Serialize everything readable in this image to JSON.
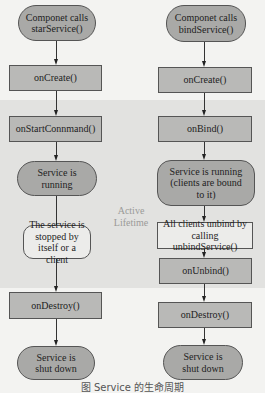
{
  "diagram": {
    "band_label": "Active Lifetime",
    "colors": {
      "background": "#f3f3f1",
      "band": "#e2e2e0",
      "rect_fill": "#b9b9b7",
      "oval_fill": "#a9a9a7",
      "light_fill": "#ececea"
    },
    "left": {
      "start": "Componet calls starService()",
      "on_create": "onCreate()",
      "on_start_command": "onStartConnmand()",
      "running": "Service is running",
      "stopped": "The service is stopped by itself or a client",
      "on_destroy": "onDestroy()",
      "shut_down": "Service is shut down"
    },
    "right": {
      "start": "Componet calls bindService()",
      "on_create": "onCreate()",
      "on_bind": "onBind()",
      "running": "Service is running (clients are bound to it)",
      "unbind": "All clients unbind by calling unbindService()",
      "on_unbind": "onUnbind()",
      "on_destroy": "onDestroy()",
      "shut_down": "Service is shut down"
    },
    "caption": "图 Service 的生命周期"
  }
}
